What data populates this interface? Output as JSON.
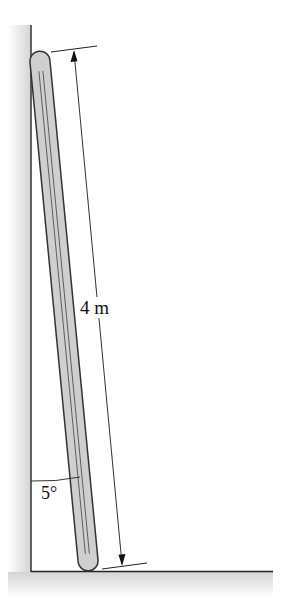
{
  "diagram": {
    "type": "ladder-against-wall",
    "labels": {
      "length": "4 m",
      "angle": "5°"
    },
    "colors": {
      "rod_fill": "#cfcfcf",
      "rod_outline": "#333333",
      "line": "#222222",
      "hatch": "#d8d8d8"
    }
  }
}
